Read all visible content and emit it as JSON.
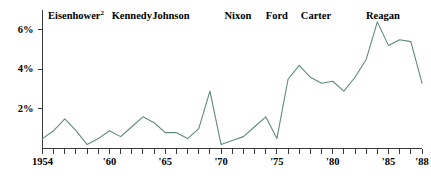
{
  "chart_data": {
    "type": "line",
    "title": "",
    "subtitle": "",
    "xlabel": "",
    "ylabel": "",
    "xlim": [
      1954,
      1988
    ],
    "ylim": [
      0,
      7.0
    ],
    "grid": false,
    "legend_position": "none",
    "line_color": "#5f8a7d",
    "axis_color": "#3a3a3a",
    "background_color": "#ffffff",
    "x": [
      1954,
      1955,
      1956,
      1957,
      1958,
      1959,
      1960,
      1961,
      1962,
      1963,
      1964,
      1965,
      1966,
      1967,
      1968,
      1969,
      1970,
      1971,
      1972,
      1973,
      1974,
      1975,
      1976,
      1977,
      1978,
      1979,
      1980,
      1981,
      1982,
      1983,
      1984,
      1985,
      1986,
      1987,
      1988
    ],
    "values": [
      0.5,
      0.9,
      1.5,
      0.9,
      0.2,
      0.5,
      0.9,
      0.6,
      1.1,
      1.6,
      1.3,
      0.8,
      0.8,
      0.5,
      1.0,
      2.9,
      0.2,
      0.4,
      0.6,
      1.1,
      1.6,
      0.5,
      3.5,
      4.2,
      3.6,
      3.3,
      3.4,
      2.9,
      3.6,
      4.5,
      6.4,
      5.2,
      5.5,
      5.4,
      3.3
    ],
    "x_tick_labels": [
      "1954",
      "'60",
      "'65",
      "'70",
      "'75",
      "'80",
      "'85",
      "'88"
    ],
    "x_tick_values": [
      1954,
      1960,
      1965,
      1970,
      1975,
      1980,
      1985,
      1988
    ],
    "y_tick_labels": [
      "2%",
      "4%",
      "6%"
    ],
    "y_tick_values": [
      2,
      4,
      6
    ],
    "x_minor_tick_step": 1,
    "annotations": [
      {
        "label": "Eisenhower",
        "superscript": "2",
        "start": 1954,
        "end": 1960
      },
      {
        "label": "Kennedy",
        "superscript": "",
        "start": 1961,
        "end": 1963
      },
      {
        "label": "Johnson",
        "superscript": "",
        "start": 1963,
        "end": 1968
      },
      {
        "label": "Nixon",
        "superscript": "",
        "start": 1969,
        "end": 1974
      },
      {
        "label": "Ford",
        "superscript": "",
        "start": 1974,
        "end": 1976
      },
      {
        "label": "Carter",
        "superscript": "",
        "start": 1977,
        "end": 1980
      },
      {
        "label": "Reagan",
        "superscript": "",
        "start": 1981,
        "end": 1988
      }
    ]
  }
}
